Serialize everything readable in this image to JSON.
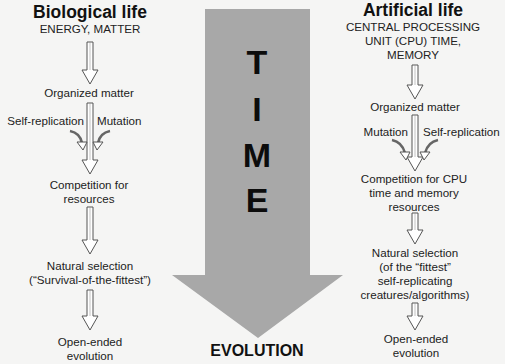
{
  "colors": {
    "background": "#f5f5f4",
    "time_arrow_fill": "#a8a8a8",
    "hollow_arrow_stroke": "#555555",
    "hollow_arrow_fill": "#ffffff",
    "text": "#1a1a1a"
  },
  "center": {
    "time_letters": [
      "T",
      "I",
      "M",
      "E"
    ],
    "outcome_label": "EVOLUTION"
  },
  "left_column": {
    "title": "Biological life",
    "resources": "ENERGY, MATTER",
    "steps": {
      "organized": "Organized matter",
      "input_left": "Self-replication",
      "input_right": "Mutation",
      "competition": [
        "Competition for",
        "resources"
      ],
      "selection": [
        "Natural selection",
        "(“Survival-of-the-fittest”)"
      ],
      "outcome": [
        "Open-ended",
        "evolution"
      ]
    }
  },
  "right_column": {
    "title": "Artificial life",
    "resources": [
      "CENTRAL PROCESSING",
      "UNIT (CPU) TIME,",
      "MEMORY"
    ],
    "steps": {
      "organized": "Organized matter",
      "input_left": "Mutation",
      "input_right": "Self-replication",
      "competition": [
        "Competition for CPU",
        "time and memory",
        "resources"
      ],
      "selection": [
        "Natural selection",
        "(of the “fittest”",
        "self-replicating",
        "creatures/algorithms)"
      ],
      "outcome": [
        "Open-ended",
        "evolution"
      ]
    }
  }
}
